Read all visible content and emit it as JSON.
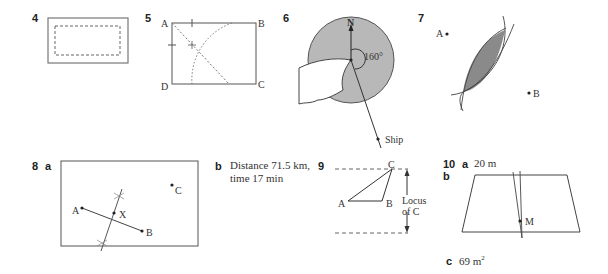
{
  "questions": {
    "q4": {
      "number": "4"
    },
    "q5": {
      "number": "5",
      "labels": {
        "a": "A",
        "b": "B",
        "c": "C",
        "d": "D"
      }
    },
    "q6": {
      "number": "6",
      "north": "N",
      "angle": "160°",
      "ship": "Ship"
    },
    "q7": {
      "number": "7",
      "point_a": "A",
      "point_b": "B"
    },
    "q8": {
      "number": "8",
      "part_a": "a",
      "part_b": "b",
      "points": {
        "a": "A",
        "b": "B",
        "c": "C",
        "x": "X"
      },
      "answer_line1": "Distance 71.5 km,",
      "answer_line2": "time 17 min"
    },
    "q9": {
      "number": "9",
      "points": {
        "a": "A",
        "b": "B",
        "c": "C"
      },
      "locus_line1": "Locus",
      "locus_line2": "of C"
    },
    "q10": {
      "number": "10",
      "part_a": "a",
      "answer_a": "20 m",
      "part_b": "b",
      "point_m": "M",
      "part_c": "c",
      "answer_c": "69 m",
      "answer_c_sup": "2"
    }
  }
}
